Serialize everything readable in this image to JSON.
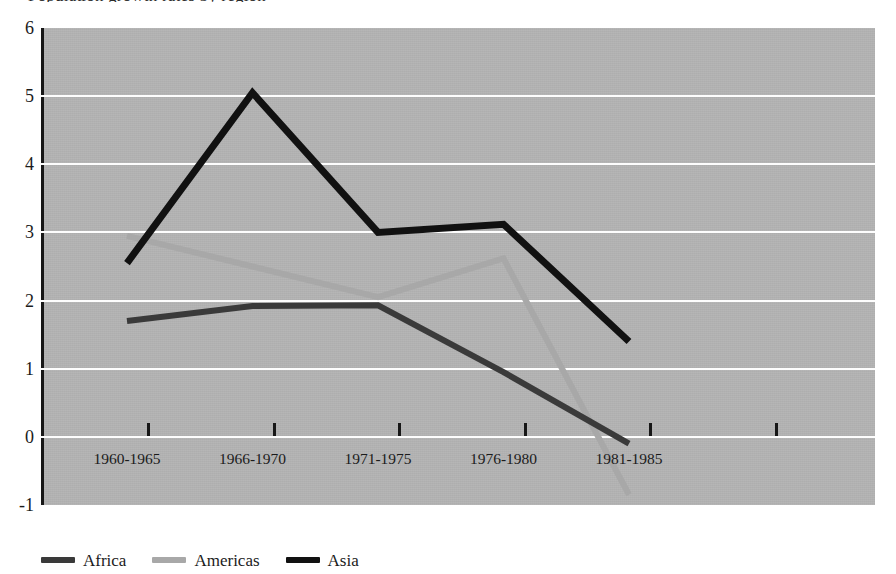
{
  "title_sliver": "Population growth rates by region",
  "chart_data": {
    "type": "line",
    "title": "",
    "xlabel": "",
    "ylabel": "",
    "categories": [
      "1960-1965",
      "1966-1970",
      "1971-1975",
      "1976-1980",
      "1981-1985"
    ],
    "ylim": [
      -1,
      6
    ],
    "yticks": [
      6,
      5,
      4,
      3,
      2,
      1,
      0,
      -1
    ],
    "ytick_labels": [
      "6",
      "5",
      "4",
      "3",
      "2",
      "1",
      "0",
      "-1"
    ],
    "grid": true,
    "grid_color": "#fdfdfd",
    "plot_background": "#b4b4b4",
    "legend_position": "bottom-left",
    "series": [
      {
        "name": "Africa",
        "color": "#3a3a3a",
        "values": [
          1.7,
          1.92,
          1.93,
          0.95,
          -0.1
        ]
      },
      {
        "name": "Americas",
        "color": "#a8a8a8",
        "values": [
          2.95,
          2.5,
          2.05,
          2.62,
          -0.85
        ]
      },
      {
        "name": "Asia",
        "color": "#111111",
        "values": [
          2.55,
          5.05,
          3.0,
          3.12,
          1.4
        ]
      }
    ]
  },
  "legend": {
    "items": [
      {
        "label": "Africa",
        "color": "#3a3a3a"
      },
      {
        "label": "Americas",
        "color": "#a8a8a8"
      },
      {
        "label": "Asia",
        "color": "#111111"
      }
    ]
  }
}
